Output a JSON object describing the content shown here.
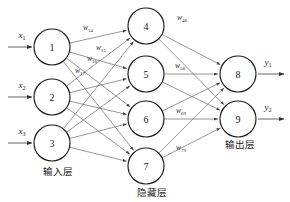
{
  "diagram": {
    "colors": {
      "background": "#ffffff",
      "node_stroke": "#1a1a1a",
      "edge": "#565656",
      "text": "#1a1a1a"
    },
    "layers": [
      {
        "id": "input",
        "label": "输入层",
        "label_x": 58,
        "label_y": 175,
        "nodes": [
          {
            "id": "n1",
            "number": "1",
            "cx": 52,
            "cy": 47,
            "r": 18
          },
          {
            "id": "n2",
            "number": "2",
            "cx": 52,
            "cy": 97,
            "r": 18
          },
          {
            "id": "n3",
            "number": "3",
            "cx": 52,
            "cy": 143,
            "r": 18
          }
        ]
      },
      {
        "id": "hidden",
        "label": "隐藏层",
        "label_x": 152,
        "label_y": 196,
        "nodes": [
          {
            "id": "n4",
            "number": "4",
            "cx": 146,
            "cy": 26,
            "r": 18
          },
          {
            "id": "n5",
            "number": "5",
            "cx": 146,
            "cy": 74,
            "r": 18
          },
          {
            "id": "n6",
            "number": "6",
            "cx": 146,
            "cy": 119,
            "r": 18
          },
          {
            "id": "n7",
            "number": "7",
            "cx": 146,
            "cy": 166,
            "r": 18
          }
        ]
      },
      {
        "id": "output",
        "label": "输出层",
        "label_x": 240,
        "label_y": 148,
        "nodes": [
          {
            "id": "n8",
            "number": "8",
            "cx": 238,
            "cy": 74,
            "r": 18
          },
          {
            "id": "n9",
            "number": "9",
            "cx": 238,
            "cy": 119,
            "r": 18
          }
        ]
      }
    ],
    "inputs": [
      {
        "id": "x1",
        "base": "x",
        "sub": "1",
        "label_x": 22,
        "label_y": 38,
        "x1": 8,
        "y1": 47,
        "x2": 32,
        "y2": 47
      },
      {
        "id": "x2",
        "base": "x",
        "sub": "2",
        "label_x": 22,
        "label_y": 88,
        "x1": 8,
        "y1": 97,
        "x2": 32,
        "y2": 97
      },
      {
        "id": "x3",
        "base": "x",
        "sub": "3",
        "label_x": 22,
        "label_y": 134,
        "x1": 8,
        "y1": 143,
        "x2": 32,
        "y2": 143
      }
    ],
    "outputs": [
      {
        "id": "y1",
        "base": "y",
        "sub": "1",
        "label_x": 268,
        "label_y": 65,
        "x1": 258,
        "y1": 74,
        "x2": 284,
        "y2": 74
      },
      {
        "id": "y2",
        "base": "y",
        "sub": "2",
        "label_x": 268,
        "label_y": 110,
        "x1": 258,
        "y1": 119,
        "x2": 284,
        "y2": 119
      }
    ],
    "weight_labels": [
      {
        "id": "w14",
        "base": "w",
        "sub": "14",
        "x": 88,
        "y": 30
      },
      {
        "id": "w15",
        "base": "w",
        "sub": "15",
        "x": 101,
        "y": 50
      },
      {
        "id": "w16",
        "base": "w",
        "sub": "16",
        "x": 92,
        "y": 61
      },
      {
        "id": "w17",
        "base": "w",
        "sub": "17",
        "x": 80,
        "y": 73
      },
      {
        "id": "w48",
        "base": "w",
        "sub": "48",
        "x": 182,
        "y": 20
      },
      {
        "id": "w58",
        "base": "w",
        "sub": "58",
        "x": 180,
        "y": 68
      },
      {
        "id": "w69",
        "base": "w",
        "sub": "69",
        "x": 181,
        "y": 113
      },
      {
        "id": "w79",
        "base": "w",
        "sub": "79",
        "x": 181,
        "y": 150
      }
    ],
    "edges": [
      {
        "from": "n1",
        "to": "n4"
      },
      {
        "from": "n1",
        "to": "n5"
      },
      {
        "from": "n1",
        "to": "n6"
      },
      {
        "from": "n1",
        "to": "n7"
      },
      {
        "from": "n2",
        "to": "n4"
      },
      {
        "from": "n2",
        "to": "n5"
      },
      {
        "from": "n2",
        "to": "n6"
      },
      {
        "from": "n2",
        "to": "n7"
      },
      {
        "from": "n3",
        "to": "n4"
      },
      {
        "from": "n3",
        "to": "n5"
      },
      {
        "from": "n3",
        "to": "n6"
      },
      {
        "from": "n3",
        "to": "n7"
      },
      {
        "from": "n4",
        "to": "n8"
      },
      {
        "from": "n4",
        "to": "n9"
      },
      {
        "from": "n5",
        "to": "n8"
      },
      {
        "from": "n5",
        "to": "n9"
      },
      {
        "from": "n6",
        "to": "n8"
      },
      {
        "from": "n6",
        "to": "n9"
      },
      {
        "from": "n7",
        "to": "n8"
      },
      {
        "from": "n7",
        "to": "n9"
      }
    ]
  }
}
